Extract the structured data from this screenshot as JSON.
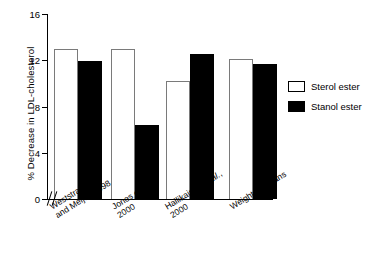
{
  "chart_data": {
    "type": "bar",
    "title": "",
    "xlabel": "",
    "ylabel": "% Decrease in LDL-cholesterol",
    "ylim": [
      0,
      16
    ],
    "yticks": [
      0,
      4,
      8,
      12,
      16
    ],
    "ytick_labels": [
      "0",
      "4",
      "8",
      "12",
      "16"
    ],
    "grid": false,
    "legend_position": "right",
    "axis_break": true,
    "axis_break_note": "//",
    "categories": [
      "Weststrate and Meijer, 1998",
      "Jones et al., 2000",
      "Hallikainen et al., 2000",
      "Weighted means"
    ],
    "category_lines": [
      [
        "Weststrate",
        "and Meijer, 1998"
      ],
      [
        "Jones et al.,",
        "2000"
      ],
      [
        "Hallikainen et al.,",
        "2000"
      ],
      [
        "Weighted means"
      ]
    ],
    "series": [
      {
        "name": "Sterol ester",
        "color": "#ffffff",
        "edge_color": "#7a7a7a",
        "values": [
          13.0,
          13.0,
          10.2,
          12.1
        ]
      },
      {
        "name": "Stanol ester",
        "color": "#000000",
        "edge_color": "#000000",
        "values": [
          11.9,
          6.4,
          12.5,
          11.7
        ]
      }
    ]
  },
  "legend": {
    "items": [
      {
        "label": "Sterol ester",
        "style": "open"
      },
      {
        "label": "Stanol ester",
        "style": "filled"
      }
    ]
  }
}
